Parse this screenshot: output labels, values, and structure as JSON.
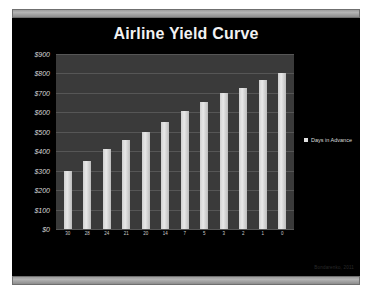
{
  "window": {
    "scrollbar_top": "horizontal-scrollbar-top",
    "scrollbar_bottom": "horizontal-scrollbar-bottom"
  },
  "watermark": "Bondarenko, 2011",
  "chart_data": {
    "type": "bar",
    "title": "Airline Yield Curve",
    "xlabel": "",
    "ylabel": "",
    "ylim": [
      0,
      900
    ],
    "grid": true,
    "legend_position": "right",
    "legend": [
      "Days in Advance"
    ],
    "categories": [
      "30",
      "28",
      "24",
      "21",
      "20",
      "14",
      "7",
      "5",
      "3",
      "2",
      "1",
      "0"
    ],
    "values": [
      300,
      350,
      410,
      460,
      500,
      550,
      605,
      655,
      700,
      725,
      765,
      800
    ],
    "tick_labels_y": [
      "$900",
      "$800",
      "$700",
      "$600",
      "$500",
      "$400",
      "$300",
      "$200",
      "$100",
      "$0"
    ],
    "tick_values_y": [
      900,
      800,
      700,
      600,
      500,
      400,
      300,
      200,
      100,
      0
    ],
    "series": [
      {
        "name": "Days in Advance",
        "values": [
          300,
          350,
          410,
          460,
          500,
          550,
          605,
          655,
          700,
          725,
          765,
          800
        ]
      }
    ]
  },
  "colors": {
    "background": "#000000",
    "plot_area": "#3a3a3a",
    "bar": "#e0e0e0",
    "gridline": "#565656",
    "text": "#f2f2f2"
  }
}
